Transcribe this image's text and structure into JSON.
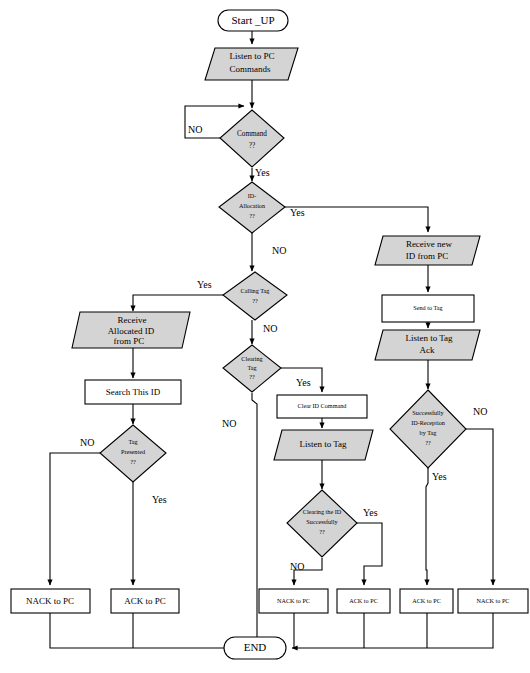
{
  "diagram": {
    "colors": {
      "process_fill": "#d4d4d4",
      "plain_fill": "#ffffff",
      "stroke": "#000000"
    },
    "nodes": {
      "start": {
        "label": "Start _UP",
        "type": "terminator"
      },
      "listen_pc": {
        "label_line1": "Listen to PC",
        "label_line2": "Commands",
        "type": "io"
      },
      "command_q": {
        "label_line1": "Command",
        "label_line2": "??",
        "type": "decision"
      },
      "id_alloc_q": {
        "label_line1": "ID-",
        "label_line2": "Allocation",
        "label_line3": "??",
        "type": "decision"
      },
      "calling_tag_q": {
        "label_line1": "Calling Tag",
        "label_line2": "??",
        "type": "decision"
      },
      "clearing_tag_q": {
        "label_line1": "Clearing",
        "label_line2": "Tag",
        "label_line3": "??",
        "type": "decision"
      },
      "receive_alloc_id": {
        "label_line1": "Receive",
        "label_line2": "Allocated ID",
        "label_line3": "from PC",
        "type": "io"
      },
      "search_this_id": {
        "label": "Search This ID",
        "type": "process"
      },
      "tag_presented_q": {
        "label_line1": "Tag",
        "label_line2": "Presented",
        "label_line3": "??",
        "type": "decision"
      },
      "clear_id_command": {
        "label": "Clear ID Command",
        "type": "process"
      },
      "listen_to_tag": {
        "label": "Listen to Tag",
        "type": "io"
      },
      "clearing_id_q": {
        "label_line1": "Clearing the ID",
        "label_line2": "Successfully",
        "label_line3": "??",
        "type": "decision"
      },
      "receive_new_id": {
        "label_line1": "Receive new",
        "label_line2": "ID from PC",
        "type": "io"
      },
      "send_to_tag": {
        "label": "Send to Tag",
        "type": "process"
      },
      "listen_tag_ack": {
        "label_line1": "Listen to Tag",
        "label_line2": "Ack",
        "type": "io"
      },
      "success_reception_q": {
        "label_line1": "Successfully",
        "label_line2": "ID-Reception",
        "label_line3": "by Tag",
        "label_line4": "??",
        "type": "decision"
      },
      "nack_1": {
        "label": "NACK to PC",
        "type": "process"
      },
      "ack_1": {
        "label": "ACK to PC",
        "type": "process"
      },
      "nack_2": {
        "label": "NACK to PC",
        "type": "process"
      },
      "ack_2": {
        "label": "ACK to PC",
        "type": "process"
      },
      "ack_3": {
        "label": "ACK to PC",
        "type": "process"
      },
      "nack_3": {
        "label": "NACK to PC",
        "type": "process"
      },
      "end": {
        "label": "END",
        "type": "terminator"
      }
    },
    "edge_labels": {
      "command_no": "NO",
      "command_yes": "Yes",
      "id_alloc_yes": "Yes",
      "id_alloc_no": "NO",
      "calling_tag_yes": "Yes",
      "calling_tag_no": "NO",
      "clearing_tag_yes": "Yes",
      "clearing_tag_no": "NO",
      "tag_presented_no": "NO",
      "tag_presented_yes": "Yes",
      "clearing_id_yes": "Yes",
      "clearing_id_no": "NO",
      "reception_no": "NO",
      "reception_yes": "Yes"
    }
  }
}
